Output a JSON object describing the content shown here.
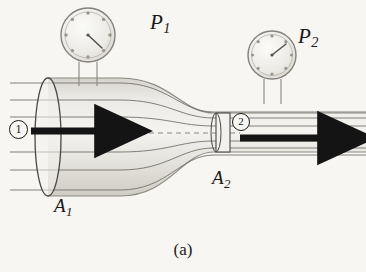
{
  "figure": {
    "caption": "(a)",
    "background_color": "#f7f6f3",
    "ink_color": "#1a1a1a",
    "pipe_fill": "#e9e7e2",
    "streamline_color": "#6f6c66"
  },
  "labels": {
    "pressure_1": "P",
    "pressure_1_sub": "1",
    "pressure_2": "P",
    "pressure_2_sub": "2",
    "area_1": "A",
    "area_1_sub": "1",
    "area_2": "A",
    "area_2_sub": "2",
    "velocity_1": "v",
    "velocity_1_sub": "1",
    "velocity_2": "v",
    "velocity_2_sub": "2",
    "point_1": "1",
    "point_2": "2"
  },
  "gauges": [
    {
      "name": "pressure-gauge-1",
      "label": "P1",
      "center_x": 88,
      "center_y": 35,
      "radius": 27,
      "tick_count": 8,
      "needle_angle_deg": 55,
      "stem_top_y": 62,
      "stem_bottom_y": 85,
      "stem_left_x": 79,
      "stem_right_x": 97
    },
    {
      "name": "pressure-gauge-2",
      "label": "P2",
      "center_x": 272,
      "center_y": 55,
      "radius": 24,
      "tick_count": 8,
      "needle_angle_deg": -35,
      "stem_top_y": 79,
      "stem_bottom_y": 103,
      "stem_left_x": 264,
      "stem_right_x": 281
    }
  ],
  "pipe": {
    "inlet_x": 48,
    "inlet_top_y": 78,
    "inlet_bottom_y": 196,
    "inlet_ellipse_rx": 13,
    "throat_x": 222,
    "throat_top_y": 113,
    "throat_bottom_y": 152,
    "throat_ellipse_rx": 6,
    "outlet_x": 366,
    "converge_start_x": 120,
    "converge_end_x": 214
  },
  "arrows": [
    {
      "name": "velocity-arrow-1",
      "x1": 31,
      "x2": 104,
      "y": 131,
      "thickness": 7
    },
    {
      "name": "velocity-arrow-2",
      "x1": 240,
      "x2": 327,
      "y": 138,
      "thickness": 7
    }
  ],
  "streamlines": [
    {
      "name": "streamline-top-1",
      "inlet_y": 83,
      "outlet_y": 112
    },
    {
      "name": "streamline-top-2",
      "inlet_y": 100,
      "outlet_y": 118
    },
    {
      "name": "streamline-top-3",
      "inlet_y": 117,
      "outlet_y": 126
    },
    {
      "name": "streamline-center",
      "inlet_y": 134,
      "outlet_y": 133
    },
    {
      "name": "streamline-bottom-3",
      "inlet_y": 152,
      "outlet_y": 141
    },
    {
      "name": "streamline-bottom-2",
      "inlet_y": 170,
      "outlet_y": 148
    },
    {
      "name": "streamline-bottom-1",
      "inlet_y": 190,
      "outlet_y": 155
    }
  ]
}
